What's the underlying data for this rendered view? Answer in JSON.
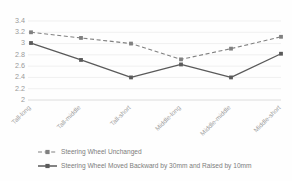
{
  "chart_data": {
    "type": "line",
    "title": "",
    "xlabel": "",
    "ylabel": "",
    "ylim": [
      2,
      3.4
    ],
    "yticks": [
      "2",
      "2.2",
      "2.4",
      "2.6",
      "2.8",
      "3",
      "3.2",
      "3.4"
    ],
    "ytick_values": [
      2,
      2.2,
      2.4,
      2.6,
      2.8,
      3,
      3.2,
      3.4
    ],
    "grid": true,
    "legend_position": "bottom-left",
    "categories": [
      "Tall-long",
      "Tall-middle",
      "Tall-short",
      "Middle-long",
      "Middle-middle",
      "Middle-short"
    ],
    "series": [
      {
        "name": "Steering Wheel Unchanged",
        "values": [
          3.2,
          3.1,
          3.0,
          2.72,
          2.91,
          3.12
        ],
        "style": "dashed",
        "color": "#808080",
        "marker": "square"
      },
      {
        "name": "Steering Wheel Moved Backward by 30mm and Raised by 10mm",
        "values": [
          3.01,
          2.71,
          2.4,
          2.63,
          2.4,
          2.82
        ],
        "style": "solid",
        "color": "#5a5a5a",
        "marker": "square"
      }
    ]
  },
  "colors": {
    "series_unchanged": "#808080",
    "series_moved": "#5a5a5a",
    "gridline": "#e9e9e9",
    "axis": "#d6d6d6",
    "tick_label": "#9a9a9a",
    "legend_label": "#7d7d7d",
    "background": "#fefefe"
  }
}
